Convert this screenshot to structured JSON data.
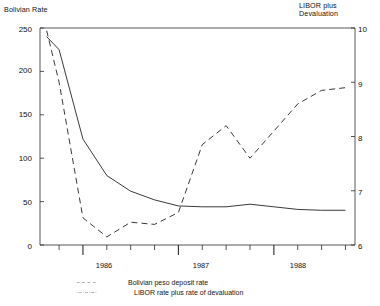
{
  "axes": {
    "left_title": "Bolivian Rate",
    "right_title": "LIBOR plus\nDevaluation",
    "left_ticks": [
      "250",
      "200",
      "150",
      "100",
      "50",
      "0"
    ],
    "right_ticks": [
      "10",
      "9",
      "8",
      "7",
      "6"
    ],
    "x_ticks": [
      "1986",
      "1987",
      "1988"
    ]
  },
  "legend": {
    "items": [
      {
        "label": "Bolivian peso deposit rate",
        "style": "dashed"
      },
      {
        "label": "LIBOR rate plus rate of devaluation",
        "style": "dash-dot"
      }
    ]
  },
  "chart_data": {
    "type": "line",
    "title": "",
    "xlabel": "",
    "ylabel": "Bolivian Rate",
    "y2label": "LIBOR plus Devaluation",
    "xlim": [
      1985.55,
      1988.85
    ],
    "ylim": [
      0,
      250
    ],
    "y2lim": [
      6,
      10
    ],
    "grid": false,
    "legend_position": "below-axes",
    "x_tick_values": [
      1986.0,
      1987.0,
      1988.0
    ],
    "x_tick_labels": [
      "1986",
      "1987",
      "1988"
    ],
    "left_tick_values": [
      0,
      50,
      100,
      150,
      200,
      250
    ],
    "right_tick_values": [
      6,
      7,
      8,
      9,
      10
    ],
    "series": [
      {
        "name": "Bolivian peso deposit rate",
        "axis": "left",
        "style": "solid",
        "x": [
          1985.62,
          1985.75,
          1986.0,
          1986.25,
          1986.5,
          1986.75,
          1987.0,
          1987.25,
          1987.5,
          1987.75,
          1988.0,
          1988.25,
          1988.5,
          1988.75
        ],
        "values": [
          240,
          225,
          122,
          80,
          62,
          52,
          45,
          44,
          44,
          47,
          44,
          41,
          40,
          40
        ]
      },
      {
        "name": "LIBOR rate plus rate of devaluation",
        "axis": "right",
        "style": "dashed",
        "x": [
          1985.62,
          1985.75,
          1986.0,
          1986.25,
          1986.5,
          1986.75,
          1987.0,
          1987.25,
          1987.5,
          1987.75,
          1988.0,
          1988.25,
          1988.5,
          1988.75
        ],
        "values": [
          9.95,
          9.0,
          6.5,
          6.15,
          6.42,
          6.38,
          6.6,
          7.85,
          8.2,
          7.6,
          8.1,
          8.6,
          8.85,
          8.9
        ]
      }
    ]
  }
}
